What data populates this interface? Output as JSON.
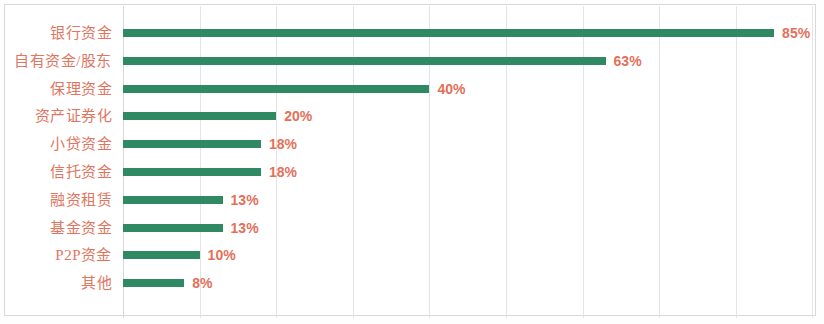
{
  "chart_data": {
    "type": "bar",
    "orientation": "horizontal",
    "title": "",
    "subtitle": "",
    "xlabel": "",
    "ylabel": "",
    "categories": [
      "银行资金",
      "自有资金/股东",
      "保理资金",
      "资产证券化",
      "小贷资金",
      "信托资金",
      "融资租赁",
      "基金资金",
      "P2P资金",
      "其他"
    ],
    "values": [
      85,
      63,
      40,
      20,
      18,
      18,
      13,
      13,
      10,
      8
    ],
    "value_labels": [
      "85%",
      "63%",
      "40%",
      "20%",
      "18%",
      "18%",
      "13%",
      "13%",
      "10%",
      "8%"
    ],
    "xlim": [
      0,
      90
    ],
    "xticks": [],
    "xtick_labels": [],
    "grid": true,
    "grid_orientation": "vertical",
    "grid_interval_percent": 10,
    "grid_count": 10,
    "legend": false,
    "legend_position": "none",
    "series": [
      {
        "name": "占比",
        "values": [
          85,
          63,
          40,
          20,
          18,
          18,
          13,
          13,
          10,
          8
        ]
      }
    ]
  },
  "style": {
    "bar_color": "#2f8a63",
    "value_label_color": "#e4705a",
    "category_label_color": "#e0765f",
    "gridline_color": "#e4e4e4",
    "frame_color": "#d8d8d8",
    "background_color": "#ffffff"
  }
}
